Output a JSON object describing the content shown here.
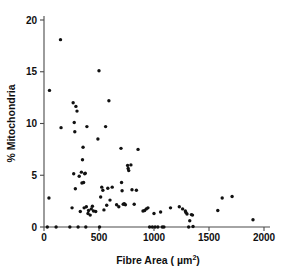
{
  "chart_data": {
    "type": "scatter",
    "title": "",
    "xlabel": "Fibre Area ( µm2)",
    "xlabel_base": "Fibre Area ( µm",
    "xlabel_exponent": "2",
    "xlabel_close": ")",
    "ylabel": "% Mitochondria",
    "xlim": [
      0,
      2000
    ],
    "ylim": [
      0,
      20
    ],
    "xticks": [
      0,
      500,
      1000,
      1500,
      2000
    ],
    "xtick_labels": [
      "0",
      "500",
      "1000",
      "1500",
      "2000"
    ],
    "yticks": [
      0,
      5,
      10,
      15,
      20
    ],
    "ytick_labels": [
      "0",
      "5",
      "10",
      "15",
      "20"
    ],
    "grid": false,
    "legend": false,
    "marker": "filled-circle",
    "marker_color": "#111111",
    "marker_size_px": 3.4,
    "n_points": 94,
    "points": [
      [
        30,
        0.0
      ],
      [
        45,
        2.8
      ],
      [
        50,
        13.2
      ],
      [
        110,
        0.0
      ],
      [
        150,
        18.1
      ],
      [
        155,
        9.6
      ],
      [
        235,
        0.0
      ],
      [
        255,
        1.85
      ],
      [
        265,
        12.0
      ],
      [
        270,
        5.15
      ],
      [
        275,
        10.1
      ],
      [
        280,
        9.2
      ],
      [
        285,
        3.7
      ],
      [
        290,
        11.65
      ],
      [
        300,
        11.2
      ],
      [
        310,
        0.0
      ],
      [
        320,
        4.9
      ],
      [
        330,
        1.5
      ],
      [
        340,
        5.3
      ],
      [
        345,
        4.25
      ],
      [
        350,
        6.5
      ],
      [
        355,
        7.7
      ],
      [
        360,
        4.3
      ],
      [
        365,
        1.85
      ],
      [
        370,
        5.15
      ],
      [
        375,
        5.2
      ],
      [
        380,
        0.0
      ],
      [
        385,
        1.95
      ],
      [
        390,
        9.7
      ],
      [
        400,
        1.3
      ],
      [
        405,
        1.6
      ],
      [
        420,
        1.15
      ],
      [
        430,
        1.75
      ],
      [
        440,
        2.0
      ],
      [
        450,
        1.55
      ],
      [
        470,
        1.5
      ],
      [
        490,
        8.5
      ],
      [
        500,
        15.1
      ],
      [
        505,
        0.0
      ],
      [
        515,
        2.9
      ],
      [
        525,
        3.85
      ],
      [
        535,
        3.55
      ],
      [
        545,
        1.65
      ],
      [
        560,
        9.7
      ],
      [
        570,
        2.1
      ],
      [
        580,
        3.75
      ],
      [
        590,
        12.2
      ],
      [
        600,
        2.6
      ],
      [
        620,
        3.85
      ],
      [
        660,
        2.15
      ],
      [
        680,
        1.95
      ],
      [
        700,
        7.6
      ],
      [
        705,
        4.3
      ],
      [
        710,
        3.5
      ],
      [
        720,
        2.2
      ],
      [
        730,
        2.25
      ],
      [
        740,
        2.15
      ],
      [
        760,
        5.95
      ],
      [
        765,
        5.65
      ],
      [
        770,
        5.45
      ],
      [
        790,
        6.0
      ],
      [
        800,
        3.6
      ],
      [
        820,
        2.2
      ],
      [
        840,
        3.55
      ],
      [
        855,
        7.5
      ],
      [
        900,
        1.55
      ],
      [
        915,
        1.6
      ],
      [
        930,
        1.75
      ],
      [
        945,
        1.85
      ],
      [
        960,
        0.0
      ],
      [
        985,
        0.0
      ],
      [
        1000,
        1.3
      ],
      [
        1010,
        0.0
      ],
      [
        1035,
        0.0
      ],
      [
        1060,
        1.45
      ],
      [
        1075,
        0.0
      ],
      [
        1090,
        0.0
      ],
      [
        1150,
        1.85
      ],
      [
        1230,
        1.95
      ],
      [
        1260,
        1.75
      ],
      [
        1285,
        1.55
      ],
      [
        1290,
        1.4
      ],
      [
        1300,
        1.25
      ],
      [
        1315,
        0.0
      ],
      [
        1325,
        0.6
      ],
      [
        1340,
        1.2
      ],
      [
        1350,
        1.15
      ],
      [
        1355,
        0.05
      ],
      [
        1580,
        1.6
      ],
      [
        1620,
        2.8
      ],
      [
        1710,
        2.95
      ],
      [
        1900,
        0.7
      ]
    ]
  },
  "figure": {
    "background": "#ffffff",
    "foreground": "#111111",
    "axis_color": "#4a4a4a"
  }
}
